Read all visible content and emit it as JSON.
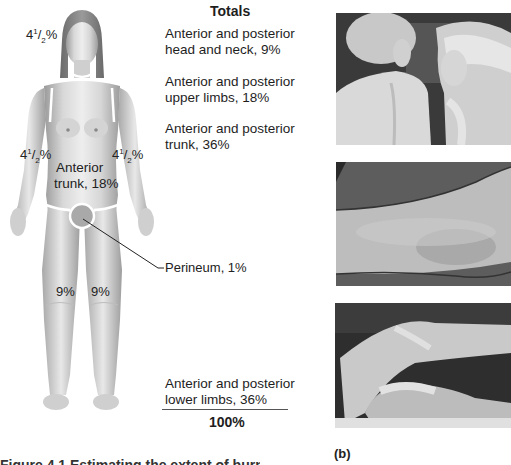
{
  "figure": {
    "body_diagram": {
      "labels": {
        "head": {
          "whole": "4",
          "num": "1",
          "den": "2",
          "suffix": "%"
        },
        "left_arm": {
          "whole": "4",
          "num": "1",
          "den": "2",
          "suffix": "%"
        },
        "right_arm": {
          "whole": "4",
          "num": "1",
          "den": "2",
          "suffix": "%"
        },
        "anterior_trunk_line1": "Anterior",
        "anterior_trunk_line2": "trunk, 18%",
        "left_leg": "9%",
        "right_leg": "9%",
        "perineum": "Perineum, 1%"
      }
    },
    "totals": {
      "heading": "Totals",
      "items": [
        {
          "line1": "Anterior and posterior",
          "line2": "head and neck, 9%"
        },
        {
          "line1": "Anterior and posterior",
          "line2": "upper limbs, 18%"
        },
        {
          "line1": "Anterior and posterior",
          "line2": "trunk, 36%"
        },
        {
          "line1": "Anterior and posterior",
          "line2": "lower limbs, 36%"
        }
      ],
      "sum": "100%"
    },
    "photos": {
      "panel_label": "(b)",
      "items": [
        {
          "name": "sunburn-back-photo"
        },
        {
          "name": "arm-burn-photo"
        },
        {
          "name": "leg-burn-photo"
        }
      ]
    },
    "caption_partial": "Figure 4.1 Estimating the extent of burns"
  }
}
